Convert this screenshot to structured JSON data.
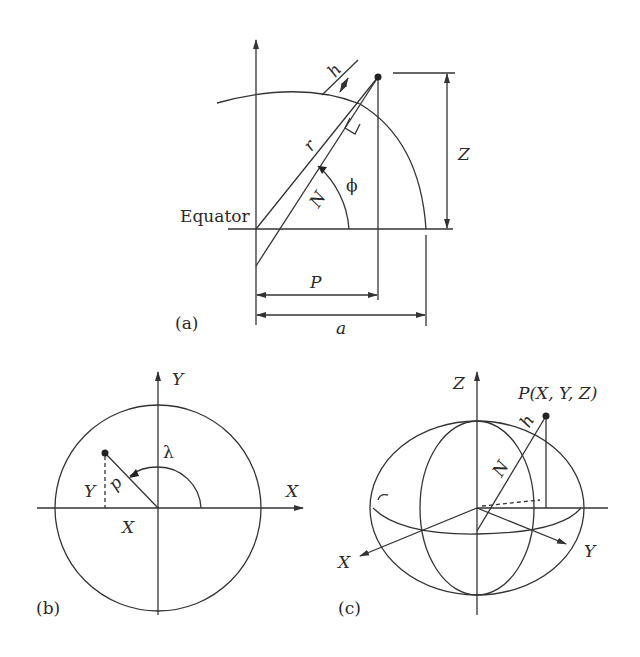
{
  "panel_a": {
    "tag": "(a)",
    "equator": "Equator",
    "labels": {
      "h": "h",
      "r": "r",
      "N": "N",
      "phi": "ϕ",
      "Z": "Z",
      "P": "P",
      "a": "a"
    }
  },
  "panel_b": {
    "tag": "(b)",
    "labels": {
      "Y_axis": "Y",
      "X_axis": "X",
      "lambda": "λ",
      "p": "p",
      "Y": "Y",
      "X": "X"
    }
  },
  "panel_c": {
    "tag": "(c)",
    "labels": {
      "Z_axis": "Z",
      "point": "P(X, Y, Z)",
      "h": "h",
      "N": "N",
      "X_axis": "X",
      "Y_axis": "Y"
    }
  }
}
